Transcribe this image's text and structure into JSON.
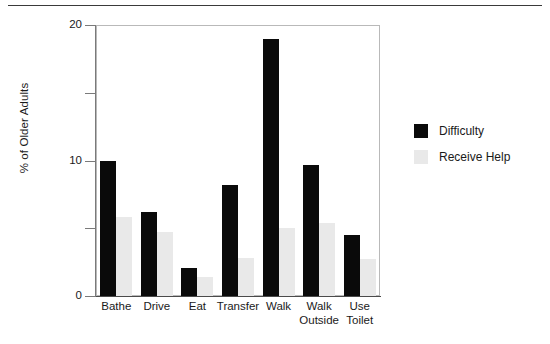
{
  "figure": {
    "background_color": "#ffffff",
    "rule_color": "#3a3a3a"
  },
  "chart_data": {
    "type": "bar",
    "title": "",
    "xlabel": "",
    "ylabel": "% of Older Adults",
    "ylim": [
      0,
      20
    ],
    "ytick_labels": [
      "0",
      "10",
      "20"
    ],
    "yticks_major": [
      0,
      10,
      20
    ],
    "yticks_minor": [
      5,
      15
    ],
    "grid": false,
    "legend_position": "right",
    "categories": [
      "Bathe",
      "Drive",
      "Eat",
      "Transfer",
      "Walk",
      "Walk\nOutside",
      "Use\nToilet"
    ],
    "series": [
      {
        "name": "Difficulty",
        "color": "#0a0a0a",
        "values": [
          10.0,
          6.2,
          2.1,
          8.2,
          19.0,
          9.7,
          4.5
        ]
      },
      {
        "name": "Receive Help",
        "color": "#e9e9e9",
        "values": [
          5.8,
          4.7,
          1.4,
          2.8,
          5.0,
          5.4,
          2.7
        ]
      }
    ]
  },
  "legend": {
    "entries": [
      {
        "label": "Difficulty",
        "color": "#0a0a0a"
      },
      {
        "label": "Receive Help",
        "color": "#e9e9e9"
      }
    ]
  }
}
